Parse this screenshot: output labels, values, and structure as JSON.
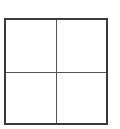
{
  "diagram": {
    "type": "2x2-grid",
    "rows": 2,
    "columns": 2,
    "cells": [
      {
        "row": 0,
        "col": 0,
        "content": ""
      },
      {
        "row": 0,
        "col": 1,
        "content": ""
      },
      {
        "row": 1,
        "col": 0,
        "content": ""
      },
      {
        "row": 1,
        "col": 1,
        "content": ""
      }
    ],
    "colors": {
      "border": "#3a3a3a",
      "divider": "#555555",
      "background": "#ffffff"
    }
  }
}
